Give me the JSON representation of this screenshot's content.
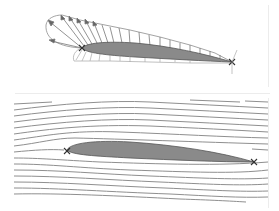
{
  "figure": {
    "title": "",
    "panels": [
      {
        "id": "pressure-distribution",
        "description": "Airfoil with surface pressure distribution vectors",
        "markers": [
          "leading-edge-x",
          "trailing-edge-x"
        ]
      },
      {
        "id": "streamlines",
        "description": "Airfoil with flow streamlines",
        "markers": [
          "leading-edge-x",
          "trailing-edge-x"
        ]
      }
    ]
  },
  "colors": {
    "airfoil_fill": "#8a8a8a",
    "airfoil_stroke": "#555555",
    "vector": "#777777",
    "envelope": "#9a9a9a",
    "streamline": "#8f8f8f",
    "marker": "#333333",
    "frame": "#ececec"
  }
}
